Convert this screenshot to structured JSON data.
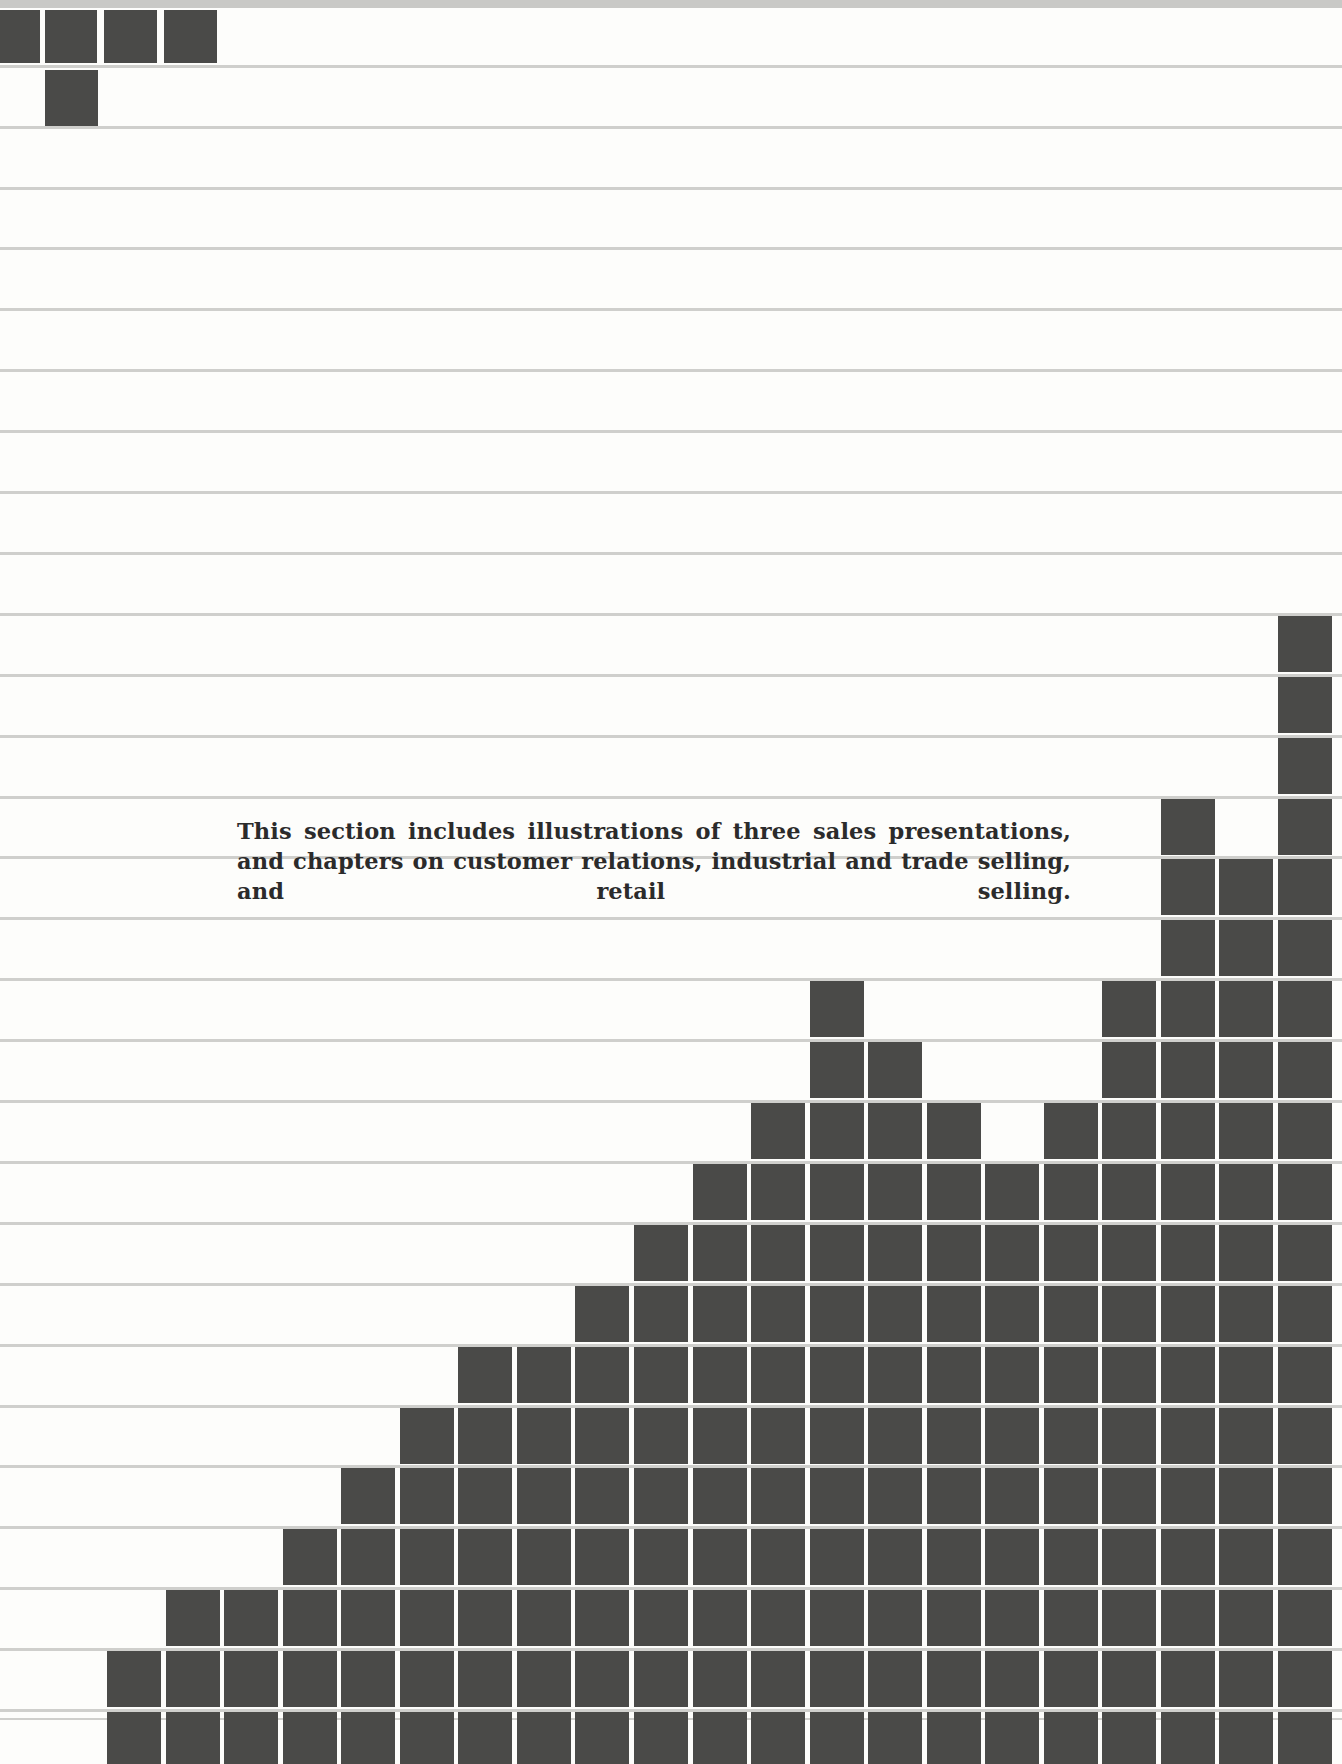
{
  "page": {
    "background_color": "#fdfdfb",
    "rule_color": "#cfcfcc",
    "bar_color": "#4a4a48",
    "text_color": "#2b2b2b"
  },
  "intro": {
    "lines": [
      "This section includes illustrations of three sales presentations, and",
      "chapters on customer relations, industrial and trade selling, and",
      "retail selling."
    ],
    "text": "This section includes illustrations of three sales presentations, and chapters on customer relations, industrial and trade selling, and retail selling."
  },
  "chart_data": {
    "type": "bar",
    "title": "",
    "xlabel": "",
    "ylabel": "",
    "grid": true,
    "legend": "none",
    "style": "stacked square blocks on ruled lines (decorative step chart)",
    "categories": [
      "1",
      "2",
      "3",
      "4",
      "5",
      "6",
      "7",
      "8",
      "9",
      "10",
      "11",
      "12",
      "13",
      "14",
      "15",
      "16",
      "17",
      "18",
      "19",
      "20",
      "21"
    ],
    "values": [
      2,
      3,
      3,
      4,
      5,
      6,
      7,
      7,
      8,
      9,
      10,
      11,
      13,
      12,
      11,
      10,
      11,
      13,
      16,
      15,
      19
    ],
    "ylim": [
      0,
      19
    ],
    "corner_blocks": {
      "top_row_count": 4,
      "second_row_count": 1
    }
  }
}
